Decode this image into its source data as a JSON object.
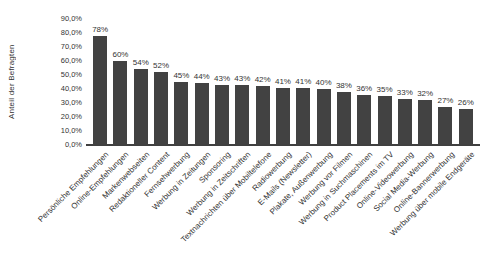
{
  "chart_data": {
    "type": "bar",
    "title": "",
    "xlabel": "",
    "ylabel": "Anteil der Befragten",
    "ylim": [
      0,
      90
    ],
    "y_tick_labels": [
      "0,0%",
      "10,0%",
      "20,0%",
      "30,0%",
      "40,0%",
      "50,0%",
      "60,0%",
      "70,0%",
      "80,0%",
      "90,0%"
    ],
    "grid": false,
    "legend": false,
    "bar_color": "#424242",
    "categories": [
      "Persönliche Empfehlungen",
      "Online-Empfehlungen",
      "Markenwebseiten",
      "Redaktioneller Content",
      "Fernsehwerbung",
      "Werbung in Zeitungen",
      "Sponsoring",
      "Werbung in Zeitschriften",
      "Textnachrichten über Mobiltelefone",
      "Radiowerbung",
      "E-Mails (Newsletter)",
      "Plakate, Außenwerbung",
      "Werbung vor Filmen",
      "Werbung in Suchmaschinen",
      "Product Placements im TV",
      "Online-Videowerbung",
      "Social Media-Werbung",
      "Online-Bannerwerbung",
      "Werbung über mobile Endgeräte"
    ],
    "values": [
      78,
      60,
      54,
      52,
      45,
      44,
      43,
      43,
      42,
      41,
      41,
      40,
      38,
      36,
      35,
      33,
      32,
      27,
      26
    ],
    "value_labels": [
      "78%",
      "60%",
      "54%",
      "52%",
      "45%",
      "44%",
      "43%",
      "43%",
      "42%",
      "41%",
      "41%",
      "40%",
      "38%",
      "36%",
      "35%",
      "33%",
      "32%",
      "27%",
      "26%"
    ]
  },
  "colors": {
    "background": "#ffffff",
    "text": "#333333",
    "axis_line": "#404040"
  }
}
